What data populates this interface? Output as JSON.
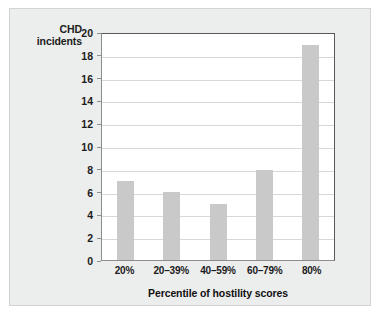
{
  "chart_data": {
    "type": "bar",
    "title": "",
    "categories": [
      "20%",
      "20–39%",
      "40–59%",
      "60–79%",
      "80%"
    ],
    "values": [
      7,
      6,
      5,
      8,
      19
    ],
    "series": [
      {
        "name": "CHD incidents",
        "values": [
          7,
          6,
          5,
          8,
          19
        ]
      }
    ],
    "xlabel": "Percentile of hostility scores",
    "ylabel": "CHD incidents",
    "ylabel_line1": "CHD",
    "ylabel_line2": "incidents",
    "ylim": [
      0,
      20
    ],
    "ytick_labels": [
      "0",
      "2",
      "4",
      "6",
      "8",
      "10",
      "12",
      "14",
      "16",
      "18",
      "20"
    ],
    "ytick_values": [
      0,
      2,
      4,
      6,
      8,
      10,
      12,
      14,
      16,
      18,
      20
    ],
    "grid": true,
    "grid_axis": "y",
    "legend": false,
    "bar_color": "#c9c9c9",
    "plot_background": "#ffffff",
    "figure_background": "#eceded",
    "axis_color": "#5a5a5a",
    "grid_color": "#d8d8d8",
    "text_color": "#1b1b1b"
  }
}
